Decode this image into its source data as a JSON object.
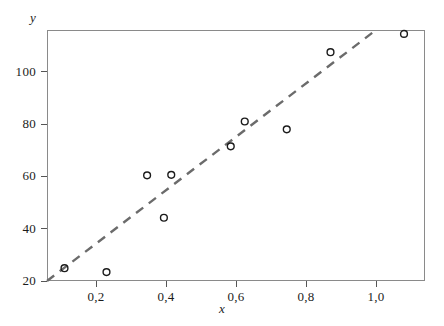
{
  "chart_data": {
    "type": "scatter",
    "title": "",
    "xlabel": "x",
    "ylabel": "y",
    "xlim": [
      0.06,
      1.14
    ],
    "ylim": [
      20,
      116
    ],
    "grid": false,
    "legend": null,
    "x_tick_labels": [
      "0,2",
      "0,4",
      "0,6",
      "0,8",
      "1,0"
    ],
    "x_tick_values": [
      0.2,
      0.4,
      0.6,
      0.8,
      1.0
    ],
    "y_tick_labels": [
      "20",
      "40",
      "60",
      "80",
      "100"
    ],
    "y_tick_values": [
      20,
      40,
      60,
      80,
      100
    ],
    "decimal_separator": ",",
    "series": [
      {
        "name": "observations",
        "marker": "open-circle",
        "marker_color": "#1b1b1b",
        "points": [
          {
            "x": 0.11,
            "y": 24.9
          },
          {
            "x": 0.23,
            "y": 23.4
          },
          {
            "x": 0.346,
            "y": 60.4
          },
          {
            "x": 0.415,
            "y": 60.6
          },
          {
            "x": 0.394,
            "y": 44.2
          },
          {
            "x": 0.585,
            "y": 71.5
          },
          {
            "x": 0.625,
            "y": 81.0
          },
          {
            "x": 0.745,
            "y": 78.0
          },
          {
            "x": 0.87,
            "y": 107.5
          },
          {
            "x": 1.08,
            "y": 114.5
          }
        ]
      }
    ],
    "trendline": {
      "name": "fitted line",
      "style": "dashed",
      "color": "#6b6b6b",
      "x_start": 0.06,
      "y_start": 20.0,
      "x_end": 1.0,
      "y_end": 116.0
    }
  },
  "axes": {
    "y_title": "y",
    "x_title": "x"
  }
}
